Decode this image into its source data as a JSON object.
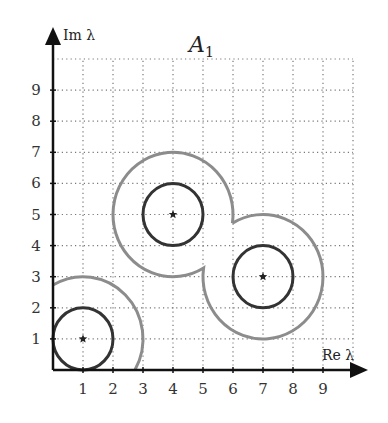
{
  "diagram": {
    "title": "A",
    "title_subscript": "1",
    "x_axis_label": "Re λ",
    "y_axis_label": "Im λ",
    "x_ticks": [
      "1",
      "2",
      "3",
      "4",
      "5",
      "6",
      "7",
      "8",
      "9"
    ],
    "y_ticks": [
      "1",
      "2",
      "3",
      "4",
      "5",
      "6",
      "7",
      "8",
      "9"
    ],
    "grid": {
      "xmin": 0,
      "xmax": 10,
      "ymin": 0,
      "ymax": 10,
      "style": "dotted"
    },
    "eigenvalues": [
      {
        "label": "λ1",
        "x": 1,
        "y": 1
      },
      {
        "label": "λ2",
        "x": 4,
        "y": 5
      },
      {
        "label": "λ3",
        "x": 7,
        "y": 3
      }
    ],
    "inner_circles": {
      "radius": 1,
      "color": "#333333"
    },
    "outer_region": {
      "radius": 2,
      "color": "#8c8c8c"
    },
    "colors": {
      "axis": "#111111",
      "grid": "#777777",
      "inner": "#333333",
      "outer": "#8c8c8c"
    }
  }
}
